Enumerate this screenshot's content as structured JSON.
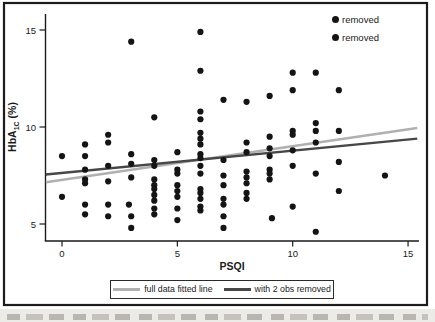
{
  "figure": {
    "top_legend": {
      "items": [
        {
          "marker": "black-dot",
          "label": "removed"
        },
        {
          "marker": "black-dot",
          "label": "removed"
        }
      ]
    },
    "bottom_legend": {
      "items": [
        {
          "label": "full data fitted line",
          "color": "#b0b0b0"
        },
        {
          "label": "with 2 obs removed",
          "color": "#474747"
        }
      ]
    },
    "border_color": "#1c1c1c"
  },
  "chart_data": {
    "type": "scatter",
    "title": "",
    "xlabel": "PSQI",
    "ylabel": "HbA1C (%)",
    "ylabel_parts": {
      "main": "HbA",
      "sub": "1C",
      "suffix": " (%)"
    },
    "x_ticks": [
      0,
      5,
      10,
      15
    ],
    "y_ticks": [
      5,
      10,
      15
    ],
    "xlim": [
      -0.75,
      15.5
    ],
    "ylim": [
      4.1,
      16.0
    ],
    "grid": false,
    "point_color": "#141414",
    "points": [
      [
        0,
        8.5
      ],
      [
        0,
        6.4
      ],
      [
        1,
        9.1
      ],
      [
        1,
        8.5
      ],
      [
        1,
        7.8
      ],
      [
        1,
        7.3
      ],
      [
        1,
        7.1
      ],
      [
        1,
        6.0
      ],
      [
        1,
        5.5
      ],
      [
        2,
        9.6
      ],
      [
        2,
        9.2
      ],
      [
        2,
        8.0
      ],
      [
        2,
        7.2
      ],
      [
        2,
        6.0
      ],
      [
        2,
        5.4
      ],
      [
        2.9,
        6.0
      ],
      [
        3,
        5.4
      ],
      [
        3,
        8.6
      ],
      [
        3,
        8.1
      ],
      [
        3,
        7.4
      ],
      [
        3,
        4.8
      ],
      [
        4,
        10.5
      ],
      [
        4,
        8.3
      ],
      [
        4,
        8.0
      ],
      [
        4,
        7.3
      ],
      [
        4,
        7.0
      ],
      [
        4,
        6.8
      ],
      [
        4,
        6.5
      ],
      [
        4,
        6.2
      ],
      [
        4,
        5.8
      ],
      [
        4,
        5.5
      ],
      [
        5,
        8.7
      ],
      [
        5,
        7.8
      ],
      [
        5,
        7.6
      ],
      [
        5,
        7.0
      ],
      [
        5,
        6.7
      ],
      [
        5,
        6.4
      ],
      [
        5,
        5.8
      ],
      [
        5,
        5.2
      ],
      [
        6,
        12.9
      ],
      [
        6,
        10.8
      ],
      [
        6,
        10.4
      ],
      [
        6,
        9.7
      ],
      [
        6,
        9.4
      ],
      [
        6,
        9.1
      ],
      [
        6,
        8.6
      ],
      [
        6,
        8.4
      ],
      [
        6,
        8.0
      ],
      [
        6,
        7.6
      ],
      [
        6,
        6.8
      ],
      [
        6,
        6.6
      ],
      [
        6,
        6.3
      ],
      [
        6,
        5.9
      ],
      [
        6,
        5.7
      ],
      [
        7,
        11.4
      ],
      [
        7,
        8.3
      ],
      [
        7,
        7.5
      ],
      [
        7,
        7.0
      ],
      [
        7,
        6.3
      ],
      [
        7,
        6.0
      ],
      [
        7,
        5.4
      ],
      [
        7,
        4.8
      ],
      [
        8,
        11.3
      ],
      [
        8,
        9.2
      ],
      [
        8,
        8.7
      ],
      [
        8,
        7.7
      ],
      [
        8,
        7.4
      ],
      [
        8,
        7.1
      ],
      [
        8,
        6.6
      ],
      [
        8,
        6.3
      ],
      [
        9,
        11.6
      ],
      [
        9,
        9.5
      ],
      [
        9,
        8.9
      ],
      [
        9,
        8.5
      ],
      [
        9,
        7.8
      ],
      [
        9,
        7.6
      ],
      [
        9,
        7.3
      ],
      [
        9.1,
        5.3
      ],
      [
        10,
        12.8
      ],
      [
        10,
        11.9
      ],
      [
        10,
        9.8
      ],
      [
        10,
        9.6
      ],
      [
        10,
        8.8
      ],
      [
        10,
        8.0
      ],
      [
        10,
        5.9
      ],
      [
        11,
        12.8
      ],
      [
        11,
        10.2
      ],
      [
        11,
        9.8
      ],
      [
        11,
        9.2
      ],
      [
        11,
        7.6
      ],
      [
        11,
        4.6
      ],
      [
        12,
        11.9
      ],
      [
        12,
        9.8
      ],
      [
        12,
        8.2
      ],
      [
        12,
        6.7
      ],
      [
        14,
        7.5
      ]
    ],
    "removed_points": [
      [
        3,
        14.4
      ],
      [
        6,
        14.9
      ]
    ],
    "fitted_lines": [
      {
        "name": "full data fitted line",
        "color": "#b0b0b0",
        "x": [
          -0.7,
          15.4
        ],
        "y": [
          7.15,
          9.95
        ]
      },
      {
        "name": "with 2 obs removed",
        "color": "#474747",
        "x": [
          -0.7,
          15.4
        ],
        "y": [
          7.55,
          9.4
        ]
      }
    ],
    "legend_top_right": [
      "removed",
      "removed"
    ],
    "legend_bottom": [
      "full data fitted line",
      "with 2 obs removed"
    ]
  }
}
